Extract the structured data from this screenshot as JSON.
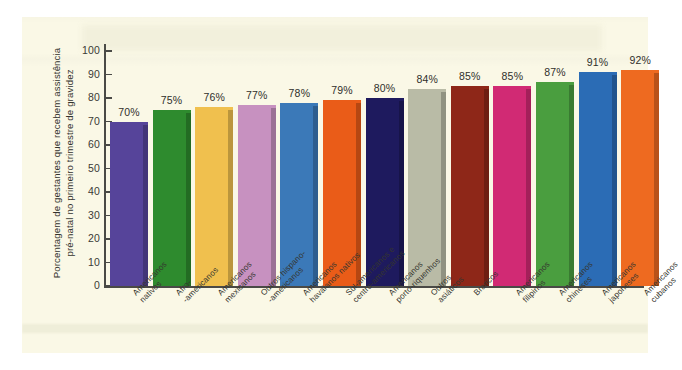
{
  "chart_data": {
    "type": "bar",
    "title": "",
    "subtitle": "",
    "xlabel": "",
    "ylabel": "Porcentagem de gestantes que recebem assistência pré-natal no primeiro trimestre de gravidez",
    "ylim": [
      0,
      100
    ],
    "ytick_values": [
      0,
      10,
      20,
      30,
      40,
      50,
      60,
      70,
      80,
      90,
      100
    ],
    "ytick_labels": [
      "0",
      "10",
      "20",
      "30",
      "40",
      "50",
      "60",
      "70",
      "80",
      "90",
      "100"
    ],
    "grid": false,
    "legend": "none",
    "categories": [
      "Americanos nativos",
      "Afro-americanos",
      "Americanos mexicanos",
      "Outros hispano-americanos",
      "Americanos havaianos nativos",
      "Sul-americanos e centro-americanos",
      "Americanos porto-riquenhos",
      "Outros asiáticos",
      "Brancos",
      "Americanos filipinos",
      "Americanos chineses",
      "Americanos japoneses",
      "Americanos cubanos"
    ],
    "category_lines": [
      [
        "Americanos",
        "nativos"
      ],
      [
        "Afro-",
        "-americanos"
      ],
      [
        "Americanos",
        "mexicanos"
      ],
      [
        "Outros hispano-",
        "-americanos"
      ],
      [
        "Americanos",
        "havaianos nativos"
      ],
      [
        "Sul-americanos e",
        "centro-americanos"
      ],
      [
        "Americanos",
        "porto-riquenhos"
      ],
      [
        "Outros",
        "asiáticos"
      ],
      [
        "Brancos",
        ""
      ],
      [
        "Americanos",
        "filipinos"
      ],
      [
        "Americanos",
        "chineses"
      ],
      [
        "Americanos",
        "japoneses"
      ],
      [
        "Americanos",
        "cubanos"
      ]
    ],
    "values": [
      70,
      75,
      76,
      77,
      78,
      79,
      80,
      84,
      85,
      85,
      87,
      91,
      92
    ],
    "value_labels": [
      "70%",
      "75%",
      "76%",
      "77%",
      "78%",
      "79%",
      "80%",
      "84%",
      "85%",
      "85%",
      "87%",
      "91%",
      "92%"
    ],
    "bar_colors": [
      "#56449a",
      "#2e8b2e",
      "#f0c04e",
      "#c791c0",
      "#3b79b8",
      "#ea5c18",
      "#1e1a5e",
      "#b9bba6",
      "#8e2718",
      "#d12a74",
      "#4a9e3f",
      "#2b6cb5",
      "#ee6a20"
    ],
    "background_color": "#faf8e6",
    "axis_color": "#4a4a46"
  }
}
